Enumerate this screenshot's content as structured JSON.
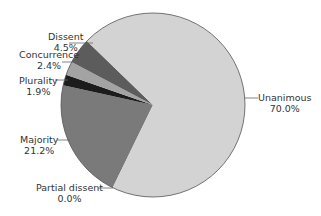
{
  "chart_data": {
    "type": "pie",
    "title": "",
    "center": [
      153,
      105
    ],
    "radius": 92,
    "start_angle_deg": 206,
    "slices": [
      {
        "label": "Partial dissent",
        "value": 0.0,
        "color": "#7a7a7a"
      },
      {
        "label": "Majority",
        "value": 21.2,
        "color": "#7a7a7a"
      },
      {
        "label": "Plurality",
        "value": 1.9,
        "color": "#1c1c1c"
      },
      {
        "label": "Concurrence",
        "value": 2.4,
        "color": "#a3a3a3"
      },
      {
        "label": "Dissent",
        "value": 4.5,
        "color": "#5c5c5c"
      },
      {
        "label": "Unanimous",
        "value": 70.0,
        "color": "#d3d3d3"
      }
    ],
    "labels": {
      "dissent": {
        "name": "Dissent",
        "pct": "4.5%"
      },
      "concurrence": {
        "name": "Concurrence",
        "pct": "2.4%"
      },
      "plurality": {
        "name": "Plurality",
        "pct": "1.9%"
      },
      "majority": {
        "name": "Majority",
        "pct": "21.2%"
      },
      "partial_dissent": {
        "name": "Partial dissent",
        "pct": "0.0%"
      },
      "unanimous": {
        "name": "Unanimous",
        "pct": "70.0%"
      }
    }
  }
}
